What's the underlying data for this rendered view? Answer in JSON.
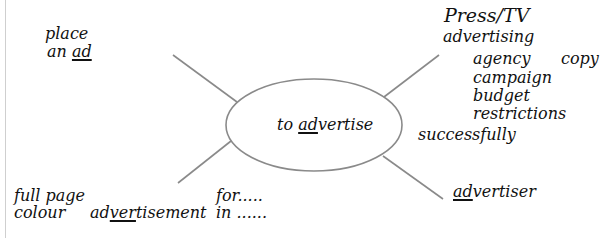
{
  "diagram": {
    "type": "mind-map",
    "center": {
      "prefix": "to ",
      "underlined": "ad",
      "suffix": "vertise"
    },
    "branches": {
      "top_left": {
        "line1": "place",
        "line2_prefix": "an ",
        "line2_underlined": "ad"
      },
      "top_right": {
        "title": "Press/TV",
        "line2": "advertising",
        "items": [
          "agency",
          "campaign",
          "budget",
          "restrictions"
        ],
        "side_item": "copy",
        "extra": "successfully"
      },
      "bottom_left": {
        "line1": "full page",
        "line2": "colour",
        "noun_prefix": "ad",
        "noun_underlined": "ver",
        "noun_suffix": "tisement",
        "prep1": "for.....",
        "prep2": "in ......"
      },
      "bottom_right": {
        "underlined": "ad",
        "suffix": "vertiser"
      }
    },
    "colors": {
      "line": "#8a8a8a",
      "text": "#111111"
    }
  }
}
